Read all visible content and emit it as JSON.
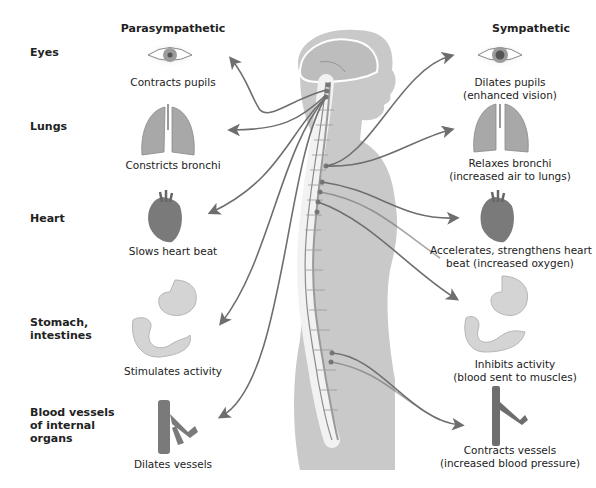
{
  "columns": {
    "parasympathetic": "Parasympathetic",
    "sympathetic": "Sympathetic"
  },
  "rows": [
    {
      "organ": "Eyes",
      "parasympathetic": "Contracts pupils",
      "sympathetic_line1": "Dilates pupils",
      "sympathetic_line2": "(enhanced vision)",
      "icon": "eye-icon"
    },
    {
      "organ": "Lungs",
      "parasympathetic": "Constricts bronchi",
      "sympathetic_line1": "Relaxes bronchi",
      "sympathetic_line2": "(increased air to lungs)",
      "icon": "lungs-icon"
    },
    {
      "organ": "Heart",
      "parasympathetic": "Slows heart beat",
      "sympathetic_line1": "Accelerates, strengthens heart",
      "sympathetic_line2": "beat (increased oxygen)",
      "icon": "heart-icon"
    },
    {
      "organ_line1": "Stomach,",
      "organ_line2": "intestines",
      "parasympathetic": "Stimulates activity",
      "sympathetic_line1": "Inhibits activity",
      "sympathetic_line2": "(blood sent to muscles)",
      "icon": "stomach-intestines-icon"
    },
    {
      "organ_line1": "Blood vessels",
      "organ_line2": "of internal",
      "organ_line3": "organs",
      "parasympathetic": "Dilates vessels",
      "sympathetic_line1": "Contracts vessels",
      "sympathetic_line2": "(increased blood pressure)",
      "icon": "blood-vessel-icon"
    }
  ],
  "colors": {
    "body": "#c9c9c9",
    "nerve": "#6e6e6e",
    "organ": "#9a9a9a",
    "heart": "#7a7a7a"
  }
}
